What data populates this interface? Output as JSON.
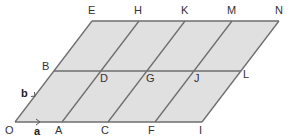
{
  "diagram": {
    "type": "parallelogram-grid",
    "colors": {
      "fill": "#e0e0e0",
      "line": "#6e6e6e",
      "text": "#333333"
    },
    "vectors": {
      "a": "a",
      "b": "b"
    },
    "rows": [
      {
        "name": "top",
        "points": [
          "E",
          "H",
          "K",
          "M",
          "N"
        ]
      },
      {
        "name": "middle",
        "points": [
          "B",
          "D",
          "G",
          "J",
          "L"
        ]
      },
      {
        "name": "bottom",
        "points": [
          "O",
          "A",
          "C",
          "F",
          "I"
        ]
      }
    ],
    "labels": {
      "E": "E",
      "H": "H",
      "K": "K",
      "M": "M",
      "N": "N",
      "B": "B",
      "D": "D",
      "G": "G",
      "J": "J",
      "L": "L",
      "O": "O",
      "A": "A",
      "C": "C",
      "F": "F",
      "I": "I"
    }
  }
}
